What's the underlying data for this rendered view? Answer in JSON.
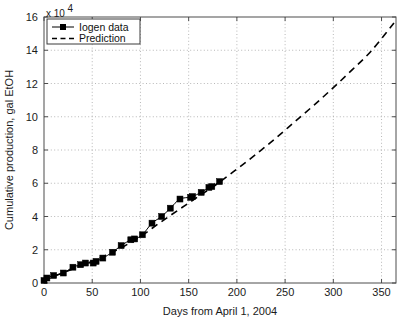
{
  "chart_data": {
    "type": "line",
    "title": "",
    "xlabel": "Days from April 1, 2004",
    "ylabel": "Cumulative production, gal EtOH",
    "y_exponent_label": "x 10",
    "y_exponent_power": "4",
    "xlim": [
      0,
      365
    ],
    "ylim": [
      0,
      16
    ],
    "xticks": [
      0,
      50,
      100,
      150,
      200,
      250,
      300,
      350
    ],
    "xtick_labels": [
      "0",
      "50",
      "100",
      "150",
      "200",
      "250",
      "300",
      "350"
    ],
    "yticks": [
      0,
      2,
      4,
      6,
      8,
      10,
      12,
      14,
      16
    ],
    "ytick_labels": [
      "0",
      "2",
      "4",
      "6",
      "8",
      "10",
      "12",
      "14",
      "16"
    ],
    "grid": true,
    "grid_style": "dotted",
    "legend_position": "top-left",
    "y_units_note": "values in units of 10^4 gal EtOH",
    "series": [
      {
        "name": "Iogen data",
        "marker": "square",
        "line_style": "solid",
        "color": "#000000",
        "x": [
          0,
          3,
          10,
          20,
          30,
          38,
          43,
          51,
          54,
          61,
          71,
          80,
          90,
          94,
          102,
          112,
          122,
          131,
          141,
          152,
          154,
          163,
          171,
          174,
          182
        ],
        "y": [
          0.15,
          0.3,
          0.45,
          0.6,
          0.95,
          1.1,
          1.2,
          1.2,
          1.3,
          1.5,
          1.85,
          2.25,
          2.6,
          2.65,
          2.9,
          3.6,
          4.0,
          4.5,
          5.05,
          5.15,
          5.2,
          5.45,
          5.75,
          5.8,
          6.1
        ]
      },
      {
        "name": "Prediction",
        "marker": "none",
        "line_style": "dashed",
        "color": "#000000",
        "x": [
          0,
          20,
          40,
          60,
          80,
          100,
          120,
          140,
          160,
          180,
          200,
          220,
          240,
          260,
          280,
          300,
          320,
          340,
          365
        ],
        "y": [
          0.15,
          0.62,
          1.08,
          1.55,
          2.12,
          2.8,
          3.62,
          4.42,
          5.2,
          5.98,
          6.85,
          7.75,
          8.7,
          9.7,
          10.7,
          11.75,
          12.85,
          14.0,
          15.8
        ]
      }
    ],
    "legend_entries": [
      {
        "label": "Iogen data",
        "marker": "square",
        "line_style": "solid"
      },
      {
        "label": "Prediction",
        "marker": "none",
        "line_style": "dashed"
      }
    ]
  }
}
